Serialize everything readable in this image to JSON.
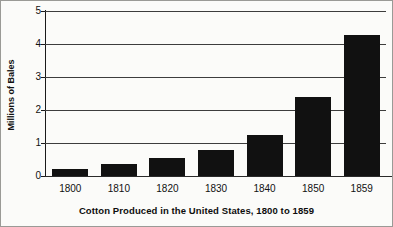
{
  "chart_data": {
    "type": "bar",
    "title": "Cotton Produced in the United States, 1800 to 1859",
    "xlabel": "",
    "ylabel": "Millions of Bales",
    "categories": [
      "1800",
      "1810",
      "1820",
      "1830",
      "1840",
      "1850",
      "1859"
    ],
    "values": [
      0.2,
      0.35,
      0.55,
      0.8,
      1.25,
      2.4,
      4.28
    ],
    "ylim": [
      0,
      5
    ],
    "ytick_labels": [
      "0",
      "1",
      "2",
      "3",
      "4",
      "5"
    ],
    "ytick_values": [
      0,
      1,
      2,
      3,
      4,
      5
    ],
    "grid": true,
    "legend": false,
    "legend_position": "none",
    "bar_color": "#111111",
    "background_color": "#fbfbf9",
    "axis_color": "#1a1a1a"
  }
}
